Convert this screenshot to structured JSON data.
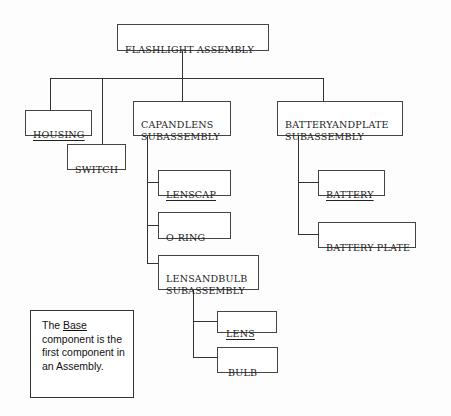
{
  "diagram": {
    "type": "assembly-tree",
    "root": {
      "id": "flashlight",
      "label": "FLASHLIGHT ASSEMBLY",
      "underline": false,
      "children": [
        {
          "id": "housing",
          "label": "HOUSING",
          "underline": true
        },
        {
          "id": "switch",
          "label": "SWITCH",
          "underline": false
        },
        {
          "id": "capandlens",
          "label": "CAPANDLENS\nSUBASSEMBLY",
          "underline": false,
          "children": [
            {
              "id": "lenscap",
              "label": "LENSCAP",
              "underline": true
            },
            {
              "id": "oring",
              "label": "O-RING",
              "underline": false
            },
            {
              "id": "lensandbulb",
              "label": "LENSANDBULB\nSUBASSEMBLY",
              "underline": false,
              "children": [
                {
                  "id": "lens",
                  "label": "LENS",
                  "underline": true
                },
                {
                  "id": "bulb",
                  "label": "BULB",
                  "underline": false
                }
              ]
            }
          ]
        },
        {
          "id": "batteryandplate",
          "label": "BATTERYANDPLATE\nSUBASSEMBLY",
          "underline": false,
          "children": [
            {
              "id": "battery",
              "label": "BATTERY",
              "underline": true
            },
            {
              "id": "batteryplate",
              "label": "BATTERY PLATE",
              "underline": false
            }
          ]
        }
      ]
    }
  },
  "nodes": {
    "flashlight": "FLASHLIGHT ASSEMBLY",
    "housing": "HOUSING",
    "switch": "SWITCH",
    "capandlens": "CAPANDLENS\nSUBASSEMBLY",
    "batteryandplate": "BATTERYANDPLATE\nSUBASSEMBLY",
    "lenscap": "LENSCAP",
    "oring": "O-RING",
    "lensandbulb": "LENSANDBULB\nSUBASSEMBLY",
    "battery": "BATTERY",
    "batteryplate": "BATTERY PLATE",
    "lens": "LENS",
    "bulb": "BULB"
  },
  "note": {
    "prefix": "The ",
    "emphasis": "Base",
    "suffix": " component is the first component in an Assembly."
  },
  "colors": {
    "line": "#333333",
    "border": "#444444",
    "text": "#222222",
    "background": "#ffffff"
  }
}
